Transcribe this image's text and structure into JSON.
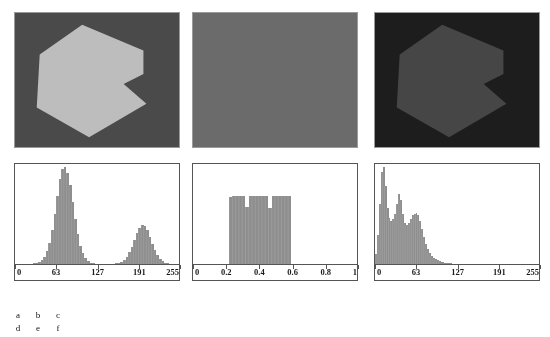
{
  "figure": {
    "panels": [
      {
        "id": "a",
        "kind": "image",
        "description": "hexagon-with-notch-bright-on-mid-gray",
        "background_color": "#4a4a4a",
        "shape_color": "#bdbdbd",
        "noise": "gaussian"
      },
      {
        "id": "b",
        "kind": "image",
        "description": "uniform-gray-noise-no-visible-shape",
        "background_color": "#6b6b6b",
        "shape_color": "#6b6b6b",
        "noise": "uniform"
      },
      {
        "id": "c",
        "kind": "image",
        "description": "hexagon-with-notch-dark-low-contrast",
        "background_color": "#1d1d1d",
        "shape_color": "#464646",
        "noise": "speckle"
      }
    ],
    "caption_grid": {
      "rows": [
        [
          "a",
          "b",
          "c"
        ],
        [
          "d",
          "e",
          "f"
        ]
      ]
    }
  },
  "chart_data": [
    {
      "id": "d",
      "type": "bar",
      "title": "",
      "xlabel": "",
      "ylabel": "",
      "xlim": [
        0,
        255
      ],
      "ylim": [
        0,
        1
      ],
      "grid": false,
      "legend": null,
      "bar_color": "#8e8e8e",
      "tick_labels": [
        "0",
        "63",
        "127",
        "191",
        "255"
      ],
      "tick_values": [
        0,
        63,
        127,
        191,
        255
      ],
      "x": [
        0,
        4,
        8,
        12,
        16,
        20,
        24,
        28,
        32,
        36,
        40,
        44,
        48,
        52,
        56,
        60,
        64,
        68,
        72,
        76,
        80,
        84,
        88,
        92,
        96,
        100,
        104,
        108,
        112,
        116,
        120,
        124,
        128,
        132,
        136,
        140,
        144,
        148,
        152,
        156,
        160,
        164,
        168,
        172,
        176,
        180,
        184,
        188,
        192,
        196,
        200,
        204,
        208,
        212,
        216,
        220,
        224,
        228,
        232,
        236,
        240,
        244,
        248,
        252,
        255
      ],
      "values": [
        0.0,
        0.0,
        0.0,
        0.0,
        0.0,
        0.0,
        0.0,
        0.01,
        0.01,
        0.02,
        0.04,
        0.07,
        0.13,
        0.22,
        0.35,
        0.52,
        0.7,
        0.88,
        0.98,
        1.0,
        0.94,
        0.81,
        0.64,
        0.46,
        0.31,
        0.19,
        0.11,
        0.06,
        0.03,
        0.01,
        0.01,
        0.0,
        0.0,
        0.0,
        0.0,
        0.0,
        0.0,
        0.0,
        0.0,
        0.01,
        0.01,
        0.02,
        0.04,
        0.07,
        0.12,
        0.18,
        0.25,
        0.32,
        0.37,
        0.4,
        0.39,
        0.35,
        0.28,
        0.21,
        0.14,
        0.09,
        0.05,
        0.03,
        0.01,
        0.01,
        0.0,
        0.0,
        0.0,
        0.0,
        0.0
      ]
    },
    {
      "id": "e",
      "type": "bar",
      "title": "",
      "xlabel": "",
      "ylabel": "",
      "xlim": [
        0,
        1
      ],
      "ylim": [
        0,
        1
      ],
      "grid": false,
      "legend": null,
      "bar_color": "#8e8e8e",
      "tick_labels": [
        "0",
        "0.2",
        "0.4",
        "0.6",
        "0.8",
        "1"
      ],
      "tick_values": [
        0,
        0.2,
        0.4,
        0.6,
        0.8,
        1
      ],
      "x": [
        0.0,
        0.02,
        0.04,
        0.06,
        0.08,
        0.1,
        0.12,
        0.14,
        0.16,
        0.18,
        0.2,
        0.22,
        0.24,
        0.26,
        0.28,
        0.3,
        0.32,
        0.34,
        0.36,
        0.38,
        0.4,
        0.42,
        0.44,
        0.46,
        0.48,
        0.5,
        0.52,
        0.54,
        0.56,
        0.58,
        0.6,
        0.62,
        0.64,
        0.66,
        0.68,
        0.7,
        0.72,
        0.74,
        0.76,
        0.78,
        0.8,
        0.82,
        0.84,
        0.86,
        0.88,
        0.9,
        0.92,
        0.94,
        0.96,
        0.98,
        1.0
      ],
      "values": [
        0.0,
        0.0,
        0.0,
        0.0,
        0.0,
        0.0,
        0.0,
        0.0,
        0.0,
        0.0,
        0.0,
        0.69,
        0.7,
        0.7,
        0.7,
        0.7,
        0.59,
        0.7,
        0.7,
        0.7,
        0.7,
        0.7,
        0.7,
        0.58,
        0.7,
        0.7,
        0.7,
        0.7,
        0.7,
        0.7,
        0.0,
        0.0,
        0.0,
        0.0,
        0.0,
        0.0,
        0.0,
        0.0,
        0.0,
        0.0,
        0.0,
        0.0,
        0.0,
        0.0,
        0.0,
        0.0,
        0.0,
        0.0,
        0.0,
        0.0,
        0.0
      ]
    },
    {
      "id": "f",
      "type": "bar",
      "title": "",
      "xlabel": "",
      "ylabel": "",
      "xlim": [
        0,
        255
      ],
      "ylim": [
        0,
        1
      ],
      "grid": false,
      "legend": null,
      "bar_color": "#8e8e8e",
      "tick_labels": [
        "0",
        "63",
        "127",
        "191",
        "255"
      ],
      "tick_values": [
        0,
        63,
        127,
        191,
        255
      ],
      "x": [
        0,
        3,
        6,
        9,
        12,
        15,
        18,
        21,
        24,
        27,
        30,
        33,
        36,
        39,
        42,
        45,
        48,
        51,
        54,
        57,
        60,
        63,
        66,
        69,
        72,
        75,
        78,
        81,
        84,
        87,
        90,
        93,
        96,
        99,
        102,
        105,
        108,
        111,
        114,
        117,
        120,
        123,
        126,
        130,
        140,
        150,
        160,
        170,
        180,
        190,
        200,
        210,
        220,
        230,
        240,
        255
      ],
      "values": [
        0.1,
        0.3,
        0.62,
        0.95,
        1.0,
        0.8,
        0.58,
        0.47,
        0.44,
        0.46,
        0.52,
        0.62,
        0.72,
        0.66,
        0.52,
        0.42,
        0.4,
        0.42,
        0.46,
        0.5,
        0.52,
        0.53,
        0.5,
        0.44,
        0.36,
        0.28,
        0.21,
        0.15,
        0.11,
        0.08,
        0.06,
        0.05,
        0.04,
        0.03,
        0.02,
        0.02,
        0.01,
        0.01,
        0.01,
        0.01,
        0.0,
        0.0,
        0.0,
        0.0,
        0.0,
        0.0,
        0.0,
        0.0,
        0.0,
        0.0,
        0.0,
        0.0,
        0.0,
        0.0,
        0.0,
        0.0
      ]
    }
  ]
}
